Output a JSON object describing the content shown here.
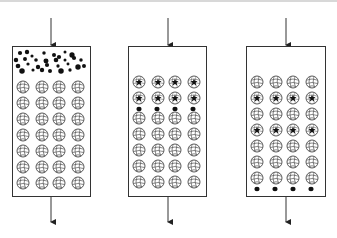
{
  "diagram": {
    "type": "column-adsorption-stages",
    "colors": {
      "stroke": "#333333",
      "particle": "#111111",
      "bead_fill": "#ffffff",
      "background": "#ffffff"
    },
    "columns": [
      {
        "id": "column-1",
        "x": 12,
        "y": 46,
        "width": 78,
        "height": 150,
        "arrow_x": 51,
        "state": "solute-loaded-above-beads",
        "free_particles_region": "top",
        "bead_rows": 7,
        "bead_cols": 4,
        "loaded_rows": [],
        "dots_row_above_bead_row": null
      },
      {
        "id": "column-2",
        "x": 128,
        "y": 46,
        "width": 78,
        "height": 150,
        "arrow_x": 168,
        "state": "solute-adsorbing-upper-beads",
        "free_particles_region": "none",
        "bead_rows": 7,
        "bead_cols": 4,
        "loaded_rows": [
          0,
          1
        ],
        "dots_row_above_bead_row": 2
      },
      {
        "id": "column-3",
        "x": 246,
        "y": 46,
        "width": 79,
        "height": 150,
        "arrow_x": 286,
        "state": "solute-eluting",
        "free_particles_region": "bottom",
        "bead_rows": 7,
        "bead_cols": 4,
        "loaded_rows": [
          1,
          3
        ],
        "dots_row_above_bead_row": null
      }
    ],
    "arrows": {
      "inlet_top_y": 18,
      "outlet_bottom_y": 222
    }
  }
}
